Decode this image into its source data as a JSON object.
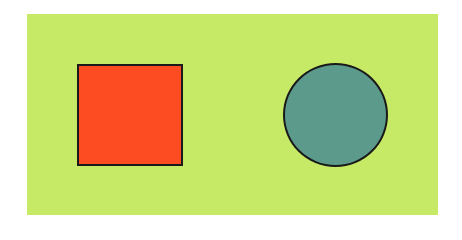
{
  "canvas": {
    "background": "#ffffff",
    "panel_color": "#c6ea66"
  },
  "shapes": [
    {
      "type": "square",
      "fill": "#fd4c22",
      "stroke": "#1a1a1a"
    },
    {
      "type": "circle",
      "fill": "#5c9a8c",
      "stroke": "#1a1a1a"
    }
  ]
}
